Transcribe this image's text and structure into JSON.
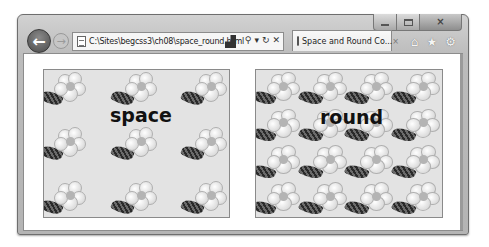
{
  "window": {
    "caption_buttons": {
      "minimize": "minimize",
      "maximize": "maximize",
      "close": "×"
    }
  },
  "nav": {
    "back_glyph": "←",
    "forward_glyph": "→"
  },
  "address_bar": {
    "url": "C:\\Sites\\begcss3\\ch08\\space_round.html",
    "search_glyph": "⚲",
    "dropdown_glyph": "▾",
    "refresh_glyph": "↻",
    "stop_glyph": "✕"
  },
  "tab": {
    "label": "Space and Round Co...",
    "close_glyph": "×"
  },
  "toolbar": {
    "home_glyph": "⌂",
    "favorites_glyph": "★",
    "tools_glyph": "⚙"
  },
  "content": {
    "boxes": [
      {
        "label": "space",
        "background_repeat": "space",
        "columns": 3,
        "rows": 3
      },
      {
        "label": "round",
        "background_repeat": "round",
        "columns": 4,
        "rows": 4
      }
    ]
  },
  "colors": {
    "frame": "#bcbcbc",
    "box_background": "#e3e3e3",
    "box_border": "#8a8a8a",
    "label_text": "#111111"
  }
}
